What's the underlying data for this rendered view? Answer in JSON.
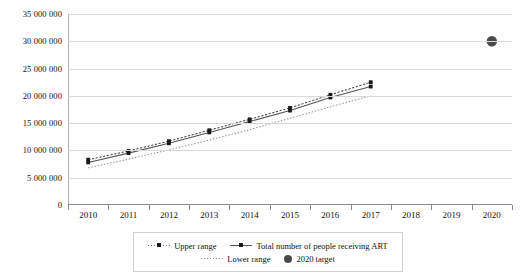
{
  "chart_data": {
    "type": "line",
    "title": "",
    "xlabel": "",
    "ylabel": "",
    "categories": [
      2010,
      2011,
      2012,
      2013,
      2014,
      2015,
      2016,
      2017,
      2018,
      2019,
      2020
    ],
    "ylim": [
      0,
      35000000
    ],
    "ytick_step": 5000000,
    "ytick_labels": [
      "35 000 000",
      "30 000 000",
      "25 000 000",
      "20 000 000",
      "15 000 000",
      "10 000 000",
      "5 000 000",
      "0"
    ],
    "ytick_values": [
      35000000,
      30000000,
      25000000,
      20000000,
      15000000,
      10000000,
      5000000,
      0
    ],
    "xtick_labels": [
      "2010",
      "2011",
      "2012",
      "2013",
      "2014",
      "2015",
      "2016",
      "2017",
      "2018",
      "2019",
      "2020"
    ],
    "grid": true,
    "legend_position": "bottom",
    "series": [
      {
        "name": "Upper range",
        "style": "dotted-with-markers",
        "color": "#3a3a3a",
        "x": [
          2010,
          2011,
          2012,
          2013,
          2014,
          2015,
          2016,
          2017
        ],
        "values": [
          8300000,
          9900000,
          11700000,
          13700000,
          15700000,
          17800000,
          20200000,
          22500000
        ]
      },
      {
        "name": "Total number of people receiving ART",
        "style": "solid-with-markers",
        "color": "#555555",
        "x": [
          2010,
          2011,
          2012,
          2013,
          2014,
          2015,
          2016,
          2017
        ],
        "values": [
          7800000,
          9500000,
          11300000,
          13300000,
          15300000,
          17300000,
          19700000,
          21700000
        ]
      },
      {
        "name": "Lower range",
        "style": "fine-dotted",
        "color": "#8a8a8a",
        "x": [
          2010,
          2011,
          2012,
          2013,
          2014,
          2015,
          2016,
          2017
        ],
        "values": [
          6800000,
          8400000,
          10100000,
          11900000,
          13800000,
          15900000,
          18000000,
          20000000
        ]
      },
      {
        "name": "2020 target",
        "style": "single-marker",
        "color": "#4a4a4a",
        "x": [
          2020
        ],
        "values": [
          30000000
        ]
      }
    ],
    "annotations": []
  },
  "legend": {
    "row1": [
      {
        "label": "Upper range",
        "marker": "dotted-square-marker"
      },
      {
        "label": "Total number of people receiving ART",
        "marker": "solid-line-marker"
      }
    ],
    "row2": [
      {
        "label": "Lower range",
        "marker": "fine-dotted-line"
      },
      {
        "label": "2020 target",
        "marker": "filled-circle"
      }
    ]
  }
}
